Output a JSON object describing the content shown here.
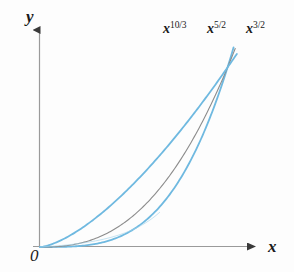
{
  "figure": {
    "kind": "math-graph",
    "background_color": "#fdfdfd",
    "axis_color": "#8e8e8e",
    "text_color": "#1a1a1a"
  },
  "axes": {
    "y_label": "y",
    "x_label": "x",
    "origin_label": "0",
    "y_arrow": "up-arrowhead",
    "x_arrow": "right-arrowhead"
  },
  "curve_labels": [
    {
      "base": "x",
      "exponent": "10/3",
      "full": "x^10/3",
      "color": "#6fb9e0"
    },
    {
      "base": "x",
      "exponent": "5/2",
      "full": "x^5/2",
      "color": "#8c8c8c"
    },
    {
      "base": "x",
      "exponent": "3/2",
      "full": "x^3/2",
      "color": "#6fb9e0"
    }
  ],
  "chart_data": {
    "type": "line",
    "title": "",
    "xlabel": "x",
    "ylabel": "y",
    "grid": false,
    "legend": "inline-curve-labels",
    "xlim": [
      0,
      1.12
    ],
    "ylim": [
      0,
      1.12
    ],
    "axis_ticks": [],
    "annotations": [
      "0"
    ],
    "series": [
      {
        "name": "x^10/3",
        "expression": "y = x^(10/3)",
        "exponent": 3.3333,
        "color": "#6fb9e0",
        "linewidth": 1.8,
        "x": [
          0,
          0.1,
          0.2,
          0.3,
          0.4,
          0.5,
          0.6,
          0.7,
          0.8,
          0.9,
          1.0,
          1.05
        ],
        "y": [
          0,
          0.00046,
          0.0047,
          0.0177,
          0.0464,
          0.0992,
          0.1866,
          0.3198,
          0.511,
          0.7726,
          1.0,
          1.18
        ]
      },
      {
        "name": "x^5/2",
        "expression": "y = x^(5/2)",
        "exponent": 2.5,
        "color": "#8c8c8c",
        "linewidth": 1.1,
        "x": [
          0,
          0.1,
          0.2,
          0.3,
          0.4,
          0.5,
          0.6,
          0.7,
          0.8,
          0.9,
          1.0,
          1.05
        ],
        "y": [
          0,
          0.0032,
          0.0179,
          0.0493,
          0.1012,
          0.1768,
          0.2788,
          0.4099,
          0.5724,
          0.7684,
          1.0,
          1.13
        ]
      },
      {
        "name": "x^3/2",
        "expression": "y = x^(3/2)",
        "exponent": 1.5,
        "color": "#6fb9e0",
        "linewidth": 1.8,
        "x": [
          0,
          0.1,
          0.2,
          0.3,
          0.4,
          0.5,
          0.6,
          0.7,
          0.8,
          0.9,
          1.0,
          1.05
        ],
        "y": [
          0,
          0.0316,
          0.0894,
          0.1643,
          0.253,
          0.3536,
          0.4648,
          0.5857,
          0.7155,
          0.8538,
          1.0,
          1.076
        ]
      }
    ]
  }
}
